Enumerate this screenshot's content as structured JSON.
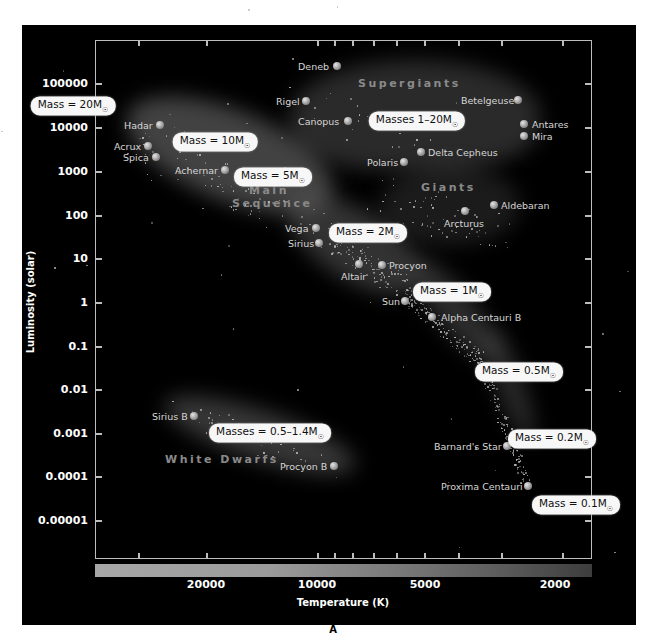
{
  "panel_letter": "A",
  "chart_data": {
    "type": "scatter",
    "xlabel": "Temperature (K)",
    "ylabel": "Luminosity (solar)",
    "x_scale": "log (reversed, hot to cool)",
    "y_scale": "log",
    "xlim": [
      40000,
      1500
    ],
    "ylim": [
      1e-06,
      1000000
    ],
    "x_ticks": [
      "20000",
      "10000",
      "5000",
      "2000"
    ],
    "y_ticks": [
      "100000",
      "10000",
      "1000",
      "100",
      "10",
      "1",
      "0.1",
      "0.01",
      "0.001",
      "0.0001",
      "0.00001"
    ],
    "grid": false,
    "colorbar": "temperature gradient (light gray hot → dark cool)",
    "regions": [
      {
        "name": "Supergiants"
      },
      {
        "name": "Giants"
      },
      {
        "name": "Main Sequence"
      },
      {
        "name": "White Dwarfs"
      }
    ],
    "stars": [
      {
        "name": "Deneb",
        "temperature": 8500,
        "luminosity": 200000
      },
      {
        "name": "Rigel",
        "temperature": 11000,
        "luminosity": 40000
      },
      {
        "name": "Canopus",
        "temperature": 7500,
        "luminosity": 13000
      },
      {
        "name": "Betelgeuse",
        "temperature": 3500,
        "luminosity": 40000
      },
      {
        "name": "Antares",
        "temperature": 3300,
        "luminosity": 12000
      },
      {
        "name": "Mira",
        "temperature": 3300,
        "luminosity": 7000
      },
      {
        "name": "Delta Cepheus",
        "temperature": 5900,
        "luminosity": 2500
      },
      {
        "name": "Polaris",
        "temperature": 6000,
        "luminosity": 1500
      },
      {
        "name": "Aldebaran",
        "temperature": 4000,
        "luminosity": 160
      },
      {
        "name": "Arcturus",
        "temperature": 4300,
        "luminosity": 120
      },
      {
        "name": "Hadar",
        "temperature": 25000,
        "luminosity": 12000
      },
      {
        "name": "Acrux",
        "temperature": 28000,
        "luminosity": 4000
      },
      {
        "name": "Spica",
        "temperature": 25000,
        "luminosity": 2000
      },
      {
        "name": "Achernar",
        "temperature": 16000,
        "luminosity": 1000
      },
      {
        "name": "Vega",
        "temperature": 9800,
        "luminosity": 50
      },
      {
        "name": "Sirius",
        "temperature": 9500,
        "luminosity": 23
      },
      {
        "name": "Altair",
        "temperature": 8000,
        "luminosity": 8
      },
      {
        "name": "Procyon",
        "temperature": 6800,
        "luminosity": 7
      },
      {
        "name": "Sun",
        "temperature": 5800,
        "luminosity": 1
      },
      {
        "name": "Alpha Centauri B",
        "temperature": 5200,
        "luminosity": 0.5
      },
      {
        "name": "Barnard's Star",
        "temperature": 3200,
        "luminosity": 0.0005
      },
      {
        "name": "Proxima Centauri",
        "temperature": 3000,
        "luminosity": 6e-05
      },
      {
        "name": "Sirius B",
        "temperature": 22000,
        "luminosity": 0.0025
      },
      {
        "name": "Procyon B",
        "temperature": 8000,
        "luminosity": 0.00015
      }
    ],
    "annotations": [
      "Mass = 20M☉",
      "Mass = 10M☉",
      "Mass = 5M☉",
      "Mass = 2M☉",
      "Mass = 1M☉",
      "Mass = 0.5M☉",
      "Mass = 0.2M☉",
      "Mass = 0.1M☉",
      "Masses 1–20M☉",
      "Masses = 0.5–1.4M☉"
    ]
  },
  "axes": {
    "y_title": "Luminosity (solar)",
    "x_title": "Temperature (K)",
    "y_ticks": [
      {
        "label": "100000",
        "y": 83
      },
      {
        "label": "10000",
        "y": 127
      },
      {
        "label": "1000",
        "y": 171
      },
      {
        "label": "100",
        "y": 215
      },
      {
        "label": "10",
        "y": 258
      },
      {
        "label": "1",
        "y": 302
      },
      {
        "label": "0.1",
        "y": 346
      },
      {
        "label": "0.01",
        "y": 389
      },
      {
        "label": "0.001",
        "y": 433
      },
      {
        "label": "0.0001",
        "y": 476
      },
      {
        "label": "0.00001",
        "y": 520
      }
    ],
    "x_ticks": [
      {
        "label": "20000",
        "x": 206
      },
      {
        "label": "10000",
        "x": 317
      },
      {
        "label": "5000",
        "x": 425
      },
      {
        "label": "2000",
        "x": 555
      }
    ]
  },
  "regions": {
    "supergiants": "Supergiants",
    "giants": "Giants",
    "main": "Main",
    "sequence": "Sequence",
    "white_dwarfs": "White Dwarfs"
  },
  "stars": [
    {
      "name": "Deneb",
      "x": 337,
      "y": 66,
      "lx": 298,
      "side": "left"
    },
    {
      "name": "Rigel",
      "x": 306,
      "y": 101,
      "lx": 276,
      "side": "left"
    },
    {
      "name": "Canopus",
      "x": 348,
      "y": 121,
      "lx": 298,
      "side": "left"
    },
    {
      "name": "Betelgeuse",
      "x": 518,
      "y": 100,
      "lx": 461,
      "side": "left"
    },
    {
      "name": "Antares",
      "x": 524,
      "y": 124,
      "lx": 532,
      "side": "right"
    },
    {
      "name": "Mira",
      "x": 524,
      "y": 136,
      "lx": 532,
      "side": "right"
    },
    {
      "name": "Delta Cepheus",
      "x": 421,
      "y": 152,
      "lx": 428,
      "side": "right"
    },
    {
      "name": "Polaris",
      "x": 404,
      "y": 162,
      "lx": 367,
      "side": "left"
    },
    {
      "name": "Aldebaran",
      "x": 494,
      "y": 205,
      "lx": 501,
      "side": "right"
    },
    {
      "name": "Arcturus",
      "x": 465,
      "y": 211,
      "lx": 444,
      "side": "below"
    },
    {
      "name": "Hadar",
      "x": 160,
      "y": 125,
      "lx": 124,
      "side": "left"
    },
    {
      "name": "Acrux",
      "x": 148,
      "y": 146,
      "lx": 114,
      "side": "left"
    },
    {
      "name": "Spica",
      "x": 156,
      "y": 157,
      "lx": 123,
      "side": "left"
    },
    {
      "name": "Achernar",
      "x": 225,
      "y": 170,
      "lx": 175,
      "side": "left"
    },
    {
      "name": "Vega",
      "x": 316,
      "y": 228,
      "lx": 285,
      "side": "left"
    },
    {
      "name": "Sirius",
      "x": 319,
      "y": 243,
      "lx": 288,
      "side": "left"
    },
    {
      "name": "Altair",
      "x": 359,
      "y": 264,
      "lx": 341,
      "side": "below"
    },
    {
      "name": "Procyon",
      "x": 382,
      "y": 265,
      "lx": 389,
      "side": "right"
    },
    {
      "name": "Sun",
      "x": 405,
      "y": 301,
      "lx": 382,
      "side": "left"
    },
    {
      "name": "Alpha Centauri B",
      "x": 432,
      "y": 317,
      "lx": 441,
      "side": "right"
    },
    {
      "name": "Barnard's Star",
      "x": 507,
      "y": 446,
      "lx": 434,
      "side": "left"
    },
    {
      "name": "Proxima Centauri",
      "x": 528,
      "y": 486,
      "lx": 441,
      "side": "left"
    },
    {
      "name": "Sirius B",
      "x": 194,
      "y": 416,
      "lx": 152,
      "side": "left"
    },
    {
      "name": "Procyon B",
      "x": 334,
      "y": 466,
      "lx": 280,
      "side": "left"
    }
  ],
  "mass_labels": [
    {
      "prefix": "Mass = 20M",
      "x": 73,
      "y": 106
    },
    {
      "prefix": "Mass = 10M",
      "x": 215,
      "y": 142
    },
    {
      "prefix": "Mass = 5M",
      "x": 273,
      "y": 177
    },
    {
      "prefix": "Mass = 2M",
      "x": 368,
      "y": 233
    },
    {
      "prefix": "Mass = 1M",
      "x": 452,
      "y": 292
    },
    {
      "prefix": "Mass = 0.5M",
      "x": 519,
      "y": 372
    },
    {
      "prefix": "Mass = 0.2M",
      "x": 552,
      "y": 439
    },
    {
      "prefix": "Mass = 0.1M",
      "x": 576,
      "y": 505
    },
    {
      "prefix": "Masses 1–20M",
      "x": 417,
      "y": 121
    },
    {
      "prefix": "Masses = 0.5–1.4M",
      "x": 270,
      "y": 433
    }
  ],
  "sun_symbol": "☉"
}
